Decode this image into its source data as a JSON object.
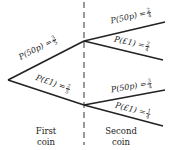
{
  "tree": {
    "first_coin": {
      "caption_line1": "First",
      "caption_line2": "coin",
      "branches": [
        {
          "event": "P(50p) =",
          "num": "3",
          "den": "5"
        },
        {
          "event": "P(£1) =",
          "num": "2",
          "den": "5"
        }
      ]
    },
    "second_coin": {
      "caption_line1": "Second",
      "caption_line2": "coin",
      "after_50p": [
        {
          "event": "P(50p) =",
          "num": "2",
          "den": "4"
        },
        {
          "event": "P(£1) =",
          "num": "2",
          "den": "4"
        }
      ],
      "after_1pound": [
        {
          "event": "P(50p) =",
          "num": "3",
          "den": "4"
        },
        {
          "event": "P(£1) =",
          "num": "1",
          "den": "4"
        }
      ]
    },
    "colors": {
      "line": "#222222",
      "divider": "#333333"
    }
  }
}
